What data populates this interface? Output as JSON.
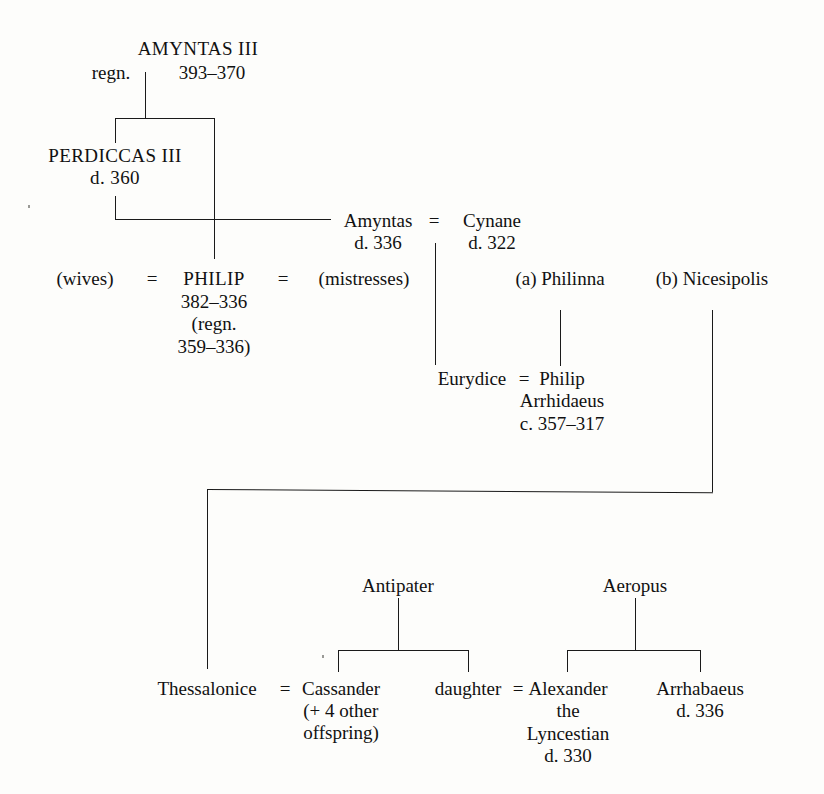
{
  "diagram": {
    "type": "genealogical-family-tree",
    "marriage_symbol": "=",
    "line_color": "#1a1a1a",
    "background_color": "#fdfdfb"
  },
  "nodes": {
    "amyntas_iii": {
      "name": "AMYNTAS III",
      "regn_label": "regn.",
      "dates": "393–370"
    },
    "perdiccas_iii": {
      "name": "PERDICCAS III",
      "dates": "d. 360"
    },
    "amyntas": {
      "name": "Amyntas",
      "dates": "d. 336"
    },
    "cynane": {
      "name": "Cynane",
      "dates": "d. 322"
    },
    "philip": {
      "name": "PHILIP",
      "dates": "382–336",
      "regn_line1": "(regn.",
      "regn_line2": "359–336)"
    },
    "wives": {
      "label": "(wives)"
    },
    "mistresses": {
      "label": "(mistresses)"
    },
    "philinna": {
      "label": "(a) Philinna"
    },
    "nicesipolis": {
      "label": "(b) Nicesipolis"
    },
    "eurydice": {
      "name": "Eurydice"
    },
    "philip_arrhidaeus": {
      "name_line1": "Philip",
      "name_line2": "Arrhidaeus",
      "dates": "c. 357–317"
    },
    "antipater": {
      "name": "Antipater"
    },
    "aeropus": {
      "name": "Aeropus"
    },
    "thessalonice": {
      "name": "Thessalonice"
    },
    "cassander": {
      "name": "Cassander",
      "note_line1": "(+ 4 other",
      "note_line2": "offspring)"
    },
    "daughter": {
      "name": "daughter"
    },
    "alexander_lyncestian": {
      "name_line1": "Alexander",
      "name_line2": "the",
      "name_line3": "Lyncestian",
      "dates": "d. 330"
    },
    "arrhabaeus": {
      "name": "Arrhabaeus",
      "dates": "d. 336"
    }
  },
  "marriages": [
    {
      "left": "(wives)",
      "right": "PHILIP",
      "symbol": "="
    },
    {
      "left": "PHILIP",
      "right": "(mistresses)",
      "symbol": "="
    },
    {
      "left": "Amyntas",
      "right": "Cynane",
      "symbol": "="
    },
    {
      "left": "Eurydice",
      "right": "Philip Arrhidaeus",
      "symbol": "="
    },
    {
      "left": "Thessalonice",
      "right": "Cassander",
      "symbol": "="
    },
    {
      "left": "daughter",
      "right": "Alexander the Lyncestian",
      "symbol": "="
    }
  ]
}
